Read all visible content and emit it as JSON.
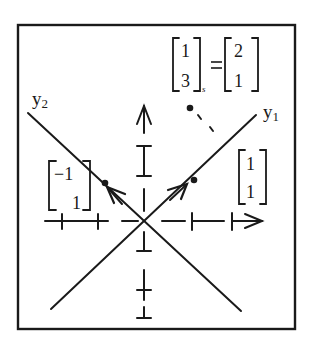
{
  "diagram": {
    "colors": {
      "ink": "#1a1a1a",
      "background": "#ffffff"
    },
    "axes": {
      "y1_label": "y",
      "y1_subscript": "1",
      "y2_label": "y",
      "y2_subscript": "2"
    },
    "vectors": {
      "neg_one_one": {
        "top": "−1",
        "bottom": "1"
      },
      "one_one": {
        "top": "1",
        "bottom": "1"
      }
    },
    "annotation": {
      "lhs_top": "1",
      "lhs_bottom": "3",
      "lhs_subscript": "s",
      "equals": "=",
      "rhs_top": "2",
      "rhs_bottom": "1"
    }
  }
}
